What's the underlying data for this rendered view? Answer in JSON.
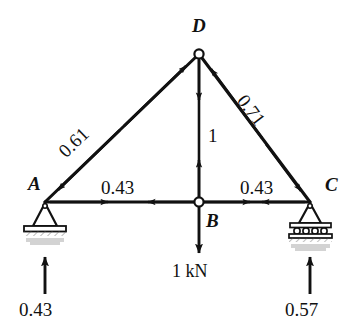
{
  "figure": {
    "type": "truss-free-body-diagram",
    "ink_color": "#111111",
    "background": "#ffffff"
  },
  "nodes": [
    {
      "id": "A",
      "label": "A",
      "x": 45,
      "y": 202,
      "support": "pin",
      "joint_marker": "none"
    },
    {
      "id": "B",
      "label": "B",
      "x": 199,
      "y": 202,
      "support": "none",
      "joint_marker": "open-circle"
    },
    {
      "id": "C",
      "label": "C",
      "x": 310,
      "y": 202,
      "support": "roller",
      "joint_marker": "none"
    },
    {
      "id": "D",
      "label": "D",
      "x": 199,
      "y": 54,
      "support": "none",
      "joint_marker": "open-circle"
    }
  ],
  "members": [
    {
      "id": "AD",
      "from": "A",
      "to": "D",
      "force": "0.61",
      "sense": "compression",
      "label_rotation_deg": -44
    },
    {
      "id": "DC",
      "from": "D",
      "to": "C",
      "force": "0.71",
      "sense": "compression",
      "label_rotation_deg": 53
    },
    {
      "id": "DB",
      "from": "D",
      "to": "B",
      "force": "1",
      "sense": "tension",
      "label_rotation_deg": 0
    },
    {
      "id": "AB",
      "from": "A",
      "to": "B",
      "force": "0.43",
      "sense": "tension",
      "label_rotation_deg": 0
    },
    {
      "id": "BC",
      "from": "B",
      "to": "C",
      "force": "0.43",
      "sense": "tension",
      "label_rotation_deg": 0
    }
  ],
  "loads": [
    {
      "id": "P-at-B",
      "at": "B",
      "label": "1 kN",
      "direction": "down"
    }
  ],
  "reactions": [
    {
      "id": "R-A",
      "at": "A",
      "label": "0.43",
      "direction": "up"
    },
    {
      "id": "R-C",
      "at": "C",
      "label": "0.57",
      "direction": "up"
    }
  ],
  "labels": {
    "node_A": "A",
    "node_B": "B",
    "node_C": "C",
    "node_D": "D",
    "member_AD": "0.61",
    "member_DC": "0.71",
    "member_DB": "1",
    "member_AB": "0.43",
    "member_BC": "0.43",
    "load_B": "1 kN",
    "reaction_A": "0.43",
    "reaction_C": "0.57"
  }
}
